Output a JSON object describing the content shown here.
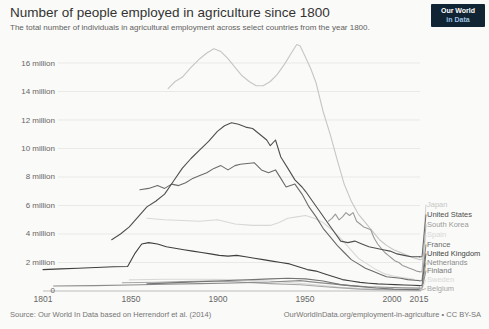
{
  "header": {
    "logo": {
      "line1": "Our World",
      "line2": "in Data"
    }
  },
  "footer": {
    "source": "Source: Our World In Data based on Herrendorf et al. (2014)",
    "link": "OurWorldInData.org/employment-in-agriculture",
    "license": " • CC BY-SA"
  },
  "chart_data": {
    "type": "line",
    "title": "Number of people employed in agriculture since 1800",
    "subtitle": "The total number of individuals in agricultural employment across select countries from the year 1800.",
    "unit": "million people",
    "xlabel": "",
    "ylabel": "",
    "xlim": [
      1801,
      2015
    ],
    "ylim_millions": [
      0,
      17.5
    ],
    "grid": "horizontal",
    "legend_position": "right",
    "x_ticks": [
      1801,
      1850,
      1900,
      1950,
      2000,
      2015
    ],
    "x_tick_labels": [
      "1801",
      "1850",
      "1900",
      "1950",
      "2000",
      "2015"
    ],
    "y_ticks_millions": [
      16,
      14,
      12,
      10,
      8,
      6,
      4,
      2,
      0
    ],
    "y_tick_labels": [
      "16 million",
      "14 million",
      "12 million",
      "10 million",
      "8 million",
      "6 million",
      "4 million",
      "2 million",
      "0"
    ],
    "series": [
      {
        "name": "Japan",
        "color": "#c6c6c6",
        "points": [
          [
            1872,
            14.2
          ],
          [
            1876,
            14.7
          ],
          [
            1880,
            15.0
          ],
          [
            1885,
            15.7
          ],
          [
            1890,
            16.3
          ],
          [
            1894,
            16.7
          ],
          [
            1898,
            17.0
          ],
          [
            1902,
            16.8
          ],
          [
            1906,
            16.3
          ],
          [
            1910,
            15.7
          ],
          [
            1914,
            15.1
          ],
          [
            1918,
            14.7
          ],
          [
            1922,
            14.4
          ],
          [
            1926,
            14.4
          ],
          [
            1930,
            14.7
          ],
          [
            1934,
            15.2
          ],
          [
            1938,
            15.9
          ],
          [
            1942,
            16.7
          ],
          [
            1945,
            17.3
          ],
          [
            1947,
            17.2
          ],
          [
            1950,
            16.4
          ],
          [
            1953,
            15.6
          ],
          [
            1956,
            14.6
          ],
          [
            1960,
            12.6
          ],
          [
            1964,
            11.0
          ],
          [
            1968,
            9.2
          ],
          [
            1972,
            7.5
          ],
          [
            1976,
            6.3
          ],
          [
            1980,
            5.4
          ],
          [
            1984,
            4.8
          ],
          [
            1988,
            4.2
          ],
          [
            1992,
            3.6
          ],
          [
            1996,
            3.2
          ],
          [
            2000,
            2.9
          ],
          [
            2004,
            2.7
          ],
          [
            2008,
            2.5
          ],
          [
            2012,
            2.3
          ],
          [
            2015,
            2.2
          ]
        ]
      },
      {
        "name": "United States",
        "color": "#4f4f4f",
        "points": [
          [
            1840,
            3.6
          ],
          [
            1845,
            4.0
          ],
          [
            1850,
            4.5
          ],
          [
            1855,
            5.2
          ],
          [
            1860,
            5.9
          ],
          [
            1865,
            6.3
          ],
          [
            1870,
            6.8
          ],
          [
            1875,
            7.7
          ],
          [
            1880,
            8.6
          ],
          [
            1885,
            9.3
          ],
          [
            1890,
            9.9
          ],
          [
            1895,
            10.5
          ],
          [
            1900,
            11.2
          ],
          [
            1904,
            11.6
          ],
          [
            1908,
            11.8
          ],
          [
            1912,
            11.7
          ],
          [
            1916,
            11.5
          ],
          [
            1920,
            11.4
          ],
          [
            1924,
            11.0
          ],
          [
            1928,
            10.6
          ],
          [
            1930,
            10.2
          ],
          [
            1933,
            10.6
          ],
          [
            1936,
            9.4
          ],
          [
            1940,
            8.6
          ],
          [
            1944,
            7.8
          ],
          [
            1948,
            7.3
          ],
          [
            1950,
            7.0
          ],
          [
            1954,
            6.3
          ],
          [
            1958,
            5.6
          ],
          [
            1962,
            4.9
          ],
          [
            1966,
            4.2
          ],
          [
            1970,
            3.5
          ],
          [
            1974,
            3.4
          ],
          [
            1978,
            3.5
          ],
          [
            1982,
            3.3
          ],
          [
            1986,
            3.1
          ],
          [
            1990,
            3.0
          ],
          [
            1994,
            2.9
          ],
          [
            1998,
            2.8
          ],
          [
            2002,
            2.6
          ],
          [
            2006,
            2.5
          ],
          [
            2010,
            2.4
          ],
          [
            2015,
            2.4
          ]
        ]
      },
      {
        "name": "South Korea",
        "color": "#9a9a9a",
        "points": [
          [
            1963,
            4.9
          ],
          [
            1965,
            5.1
          ],
          [
            1967,
            5.4
          ],
          [
            1969,
            5.0
          ],
          [
            1971,
            5.2
          ],
          [
            1973,
            5.5
          ],
          [
            1975,
            5.3
          ],
          [
            1977,
            5.5
          ],
          [
            1979,
            4.9
          ],
          [
            1981,
            4.7
          ],
          [
            1983,
            4.5
          ],
          [
            1985,
            4.4
          ],
          [
            1987,
            4.3
          ],
          [
            1989,
            3.7
          ],
          [
            1991,
            3.3
          ],
          [
            1993,
            3.0
          ],
          [
            1995,
            2.7
          ],
          [
            1997,
            2.5
          ],
          [
            1999,
            2.3
          ],
          [
            2001,
            2.1
          ],
          [
            2003,
            2.0
          ],
          [
            2005,
            1.8
          ],
          [
            2007,
            1.7
          ],
          [
            2009,
            1.6
          ],
          [
            2011,
            1.5
          ],
          [
            2013,
            1.4
          ],
          [
            2015,
            1.35
          ]
        ]
      },
      {
        "name": "Spain",
        "color": "#d8d8d8",
        "points": [
          [
            1860,
            5.1
          ],
          [
            1870,
            5.0
          ],
          [
            1880,
            4.95
          ],
          [
            1890,
            4.9
          ],
          [
            1900,
            5.0
          ],
          [
            1910,
            4.7
          ],
          [
            1920,
            4.6
          ],
          [
            1930,
            4.6
          ],
          [
            1935,
            4.8
          ],
          [
            1940,
            5.1
          ],
          [
            1945,
            5.2
          ],
          [
            1950,
            5.3
          ],
          [
            1955,
            5.1
          ],
          [
            1960,
            4.8
          ],
          [
            1965,
            4.3
          ],
          [
            1970,
            3.7
          ],
          [
            1975,
            3.0
          ],
          [
            1980,
            2.3
          ],
          [
            1985,
            1.9
          ],
          [
            1990,
            1.5
          ],
          [
            1995,
            1.2
          ],
          [
            2000,
            1.05
          ],
          [
            2005,
            0.95
          ],
          [
            2010,
            0.85
          ],
          [
            2015,
            0.74
          ]
        ]
      },
      {
        "name": "France",
        "color": "#6b6b6b",
        "points": [
          [
            1856,
            7.1
          ],
          [
            1861,
            7.2
          ],
          [
            1866,
            7.4
          ],
          [
            1870,
            7.2
          ],
          [
            1874,
            7.5
          ],
          [
            1878,
            7.4
          ],
          [
            1882,
            7.6
          ],
          [
            1886,
            7.9
          ],
          [
            1890,
            8.1
          ],
          [
            1894,
            8.3
          ],
          [
            1898,
            8.6
          ],
          [
            1902,
            8.8
          ],
          [
            1906,
            8.5
          ],
          [
            1910,
            8.8
          ],
          [
            1913,
            8.9
          ],
          [
            1921,
            9.0
          ],
          [
            1925,
            8.5
          ],
          [
            1929,
            8.3
          ],
          [
            1933,
            8.5
          ],
          [
            1936,
            7.9
          ],
          [
            1939,
            7.3
          ],
          [
            1944,
            7.5
          ],
          [
            1948,
            6.8
          ],
          [
            1952,
            5.9
          ],
          [
            1956,
            5.2
          ],
          [
            1960,
            4.4
          ],
          [
            1964,
            3.8
          ],
          [
            1968,
            3.2
          ],
          [
            1972,
            2.7
          ],
          [
            1976,
            2.2
          ],
          [
            1980,
            1.9
          ],
          [
            1984,
            1.6
          ],
          [
            1988,
            1.4
          ],
          [
            1992,
            1.2
          ],
          [
            1996,
            1.0
          ],
          [
            2000,
            0.95
          ],
          [
            2004,
            0.9
          ],
          [
            2008,
            0.8
          ],
          [
            2012,
            0.75
          ],
          [
            2015,
            0.72
          ]
        ]
      },
      {
        "name": "United Kingdom",
        "color": "#3f3f3f",
        "points": [
          [
            1801,
            1.5
          ],
          [
            1811,
            1.55
          ],
          [
            1821,
            1.6
          ],
          [
            1831,
            1.65
          ],
          [
            1841,
            1.7
          ],
          [
            1849,
            1.72
          ],
          [
            1853,
            2.6
          ],
          [
            1857,
            3.3
          ],
          [
            1861,
            3.4
          ],
          [
            1866,
            3.3
          ],
          [
            1871,
            3.1
          ],
          [
            1876,
            3.0
          ],
          [
            1881,
            2.9
          ],
          [
            1886,
            2.8
          ],
          [
            1891,
            2.7
          ],
          [
            1896,
            2.6
          ],
          [
            1901,
            2.5
          ],
          [
            1906,
            2.45
          ],
          [
            1911,
            2.5
          ],
          [
            1916,
            2.4
          ],
          [
            1921,
            2.3
          ],
          [
            1926,
            2.2
          ],
          [
            1931,
            2.1
          ],
          [
            1936,
            2.0
          ],
          [
            1941,
            1.9
          ],
          [
            1946,
            1.7
          ],
          [
            1951,
            1.5
          ],
          [
            1956,
            1.4
          ],
          [
            1961,
            1.2
          ],
          [
            1966,
            1.0
          ],
          [
            1971,
            0.8
          ],
          [
            1976,
            0.7
          ],
          [
            1981,
            0.6
          ],
          [
            1986,
            0.55
          ],
          [
            1991,
            0.5
          ],
          [
            1996,
            0.48
          ],
          [
            2001,
            0.45
          ],
          [
            2006,
            0.42
          ],
          [
            2011,
            0.4
          ],
          [
            2015,
            0.38
          ]
        ]
      },
      {
        "name": "Netherlands",
        "color": "#8c8c8c",
        "points": [
          [
            1807,
            0.35
          ],
          [
            1830,
            0.38
          ],
          [
            1850,
            0.42
          ],
          [
            1870,
            0.48
          ],
          [
            1890,
            0.52
          ],
          [
            1909,
            0.56
          ],
          [
            1920,
            0.6
          ],
          [
            1930,
            0.63
          ],
          [
            1947,
            0.73
          ],
          [
            1956,
            0.6
          ],
          [
            1965,
            0.5
          ],
          [
            1975,
            0.38
          ],
          [
            1985,
            0.3
          ],
          [
            1995,
            0.27
          ],
          [
            2005,
            0.23
          ],
          [
            2015,
            0.2
          ]
        ]
      },
      {
        "name": "Finland",
        "color": "#757575",
        "points": [
          [
            1860,
            0.5
          ],
          [
            1880,
            0.6
          ],
          [
            1900,
            0.7
          ],
          [
            1910,
            0.75
          ],
          [
            1920,
            0.8
          ],
          [
            1930,
            0.85
          ],
          [
            1940,
            0.9
          ],
          [
            1950,
            0.85
          ],
          [
            1960,
            0.7
          ],
          [
            1970,
            0.45
          ],
          [
            1980,
            0.32
          ],
          [
            1990,
            0.21
          ],
          [
            2000,
            0.13
          ],
          [
            2015,
            0.1
          ]
        ]
      },
      {
        "name": "Sweden",
        "color": "#d9d9d9",
        "points": [
          [
            1850,
            0.78
          ],
          [
            1870,
            0.82
          ],
          [
            1890,
            0.83
          ],
          [
            1910,
            0.8
          ],
          [
            1930,
            0.7
          ],
          [
            1950,
            0.5
          ],
          [
            1960,
            0.38
          ],
          [
            1970,
            0.26
          ],
          [
            1980,
            0.18
          ],
          [
            1990,
            0.14
          ],
          [
            2000,
            0.11
          ],
          [
            2015,
            0.1
          ]
        ]
      },
      {
        "name": "Belgium",
        "color": "#a6a6a6",
        "points": [
          [
            1846,
            0.58
          ],
          [
            1866,
            0.62
          ],
          [
            1880,
            0.66
          ],
          [
            1895,
            0.7
          ],
          [
            1910,
            0.65
          ],
          [
            1920,
            0.58
          ],
          [
            1930,
            0.52
          ],
          [
            1947,
            0.44
          ],
          [
            1961,
            0.3
          ],
          [
            1970,
            0.22
          ],
          [
            1981,
            0.13
          ],
          [
            1990,
            0.1
          ],
          [
            2000,
            0.08
          ],
          [
            2015,
            0.06
          ]
        ]
      }
    ]
  }
}
